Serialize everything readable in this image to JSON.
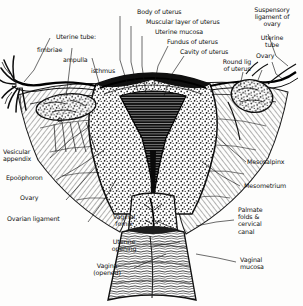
{
  "figure": {
    "style": "black-and-white engraved anatomical line drawing with hand-lettered labels",
    "background_color": "#fdfdfc",
    "ink_color": "#111111"
  },
  "labels": {
    "uterine_tube_group": "Uterine tube:",
    "fimbriae": "fimbriae",
    "ampulla": "ampulla",
    "isthmus": "isthmus",
    "body_of_uterus": "Body of uterus",
    "muscular_layer_of_uterus": "Muscular layer of uterus",
    "uterine_mucosa": "Uterine mucosa",
    "fundus_of_uterus": "Fundus of uterus",
    "cavity_of_uterus": "Cavity of uterus",
    "suspensory_ligament_of_ovary": "Suspensory\nligament of\novary",
    "uterine_tube_right": "Uterine\ntube",
    "ovary_right": "Ovary",
    "round_ligament_of_uterus": "Round lig\nof uterus",
    "vesicular_appendix": "Vesicular\nappendix",
    "epoophoron": "Epoöphoron",
    "ovary_left": "Ovary",
    "ovarian_ligament": "Ovarian ligament",
    "mesosalpinx": "Mesosalpinx",
    "mesometrium": "Mesometrium",
    "palmate_folds_cervical_canal": "Palmate\nfolds &\ncervical\ncanal",
    "vaginal_mucosa": "Vaginal\nmucosa",
    "vaginal_fornix": "Vaginal\nfornix",
    "uterine_opening": "Uterine\nopening",
    "vagina_opened": "Vagina\n(opened)"
  }
}
